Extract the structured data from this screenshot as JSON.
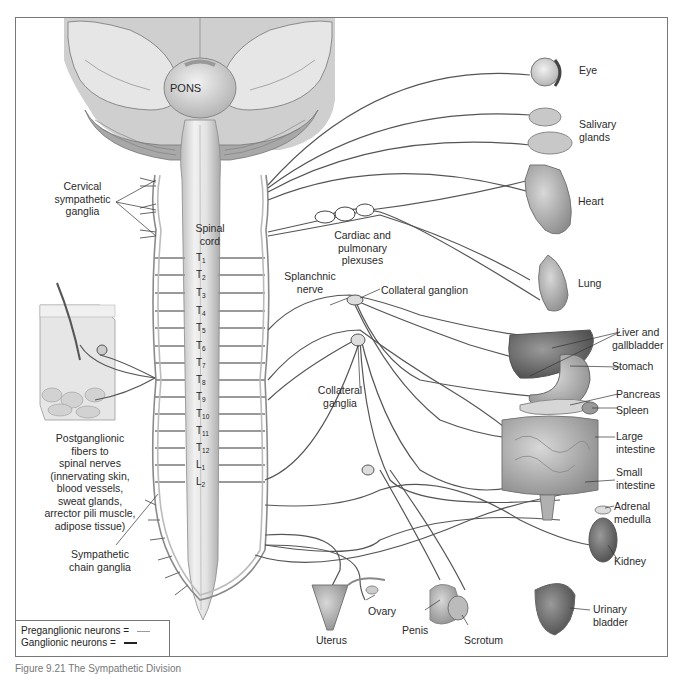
{
  "diagram": {
    "title_caption": "Figure 9.21 The Sympathetic Division",
    "brain_label": "PONS",
    "spinal_cord_label": "Spinal cord",
    "segments": [
      {
        "letter": "T",
        "sub": "1"
      },
      {
        "letter": "T",
        "sub": "2"
      },
      {
        "letter": "T",
        "sub": "3"
      },
      {
        "letter": "T",
        "sub": "4"
      },
      {
        "letter": "T",
        "sub": "5"
      },
      {
        "letter": "T",
        "sub": "6"
      },
      {
        "letter": "T",
        "sub": "7"
      },
      {
        "letter": "T",
        "sub": "8"
      },
      {
        "letter": "T",
        "sub": "9"
      },
      {
        "letter": "T",
        "sub": "10"
      },
      {
        "letter": "T",
        "sub": "11"
      },
      {
        "letter": "T",
        "sub": "12"
      },
      {
        "letter": "L",
        "sub": "1"
      },
      {
        "letter": "L",
        "sub": "2"
      }
    ],
    "left_labels": {
      "cervical": [
        "Cervical",
        "sympathetic",
        "ganglia"
      ],
      "postganglionic": [
        "Postganglionic",
        "fibers to",
        "spinal nerves",
        "(innervating skin,",
        "blood vessels,",
        "sweat glands,",
        "arrector pili muscle,",
        "adipose tissue)"
      ],
      "chain": [
        "Sympathetic",
        "chain ganglia"
      ]
    },
    "center_labels": {
      "cardiac": [
        "Cardiac and",
        "pulmonary",
        "plexuses"
      ],
      "splanchnic": [
        "Splanchnic",
        "nerve"
      ],
      "collateral_ganglion": "Collateral ganglion",
      "collateral_ganglia": [
        "Collateral",
        "ganglia"
      ]
    },
    "organs": {
      "eye": "Eye",
      "salivary": [
        "Salivary",
        "glands"
      ],
      "heart": "Heart",
      "lung": "Lung",
      "liver": [
        "Liver and",
        "gallbladder"
      ],
      "stomach": "Stomach",
      "pancreas": "Pancreas",
      "spleen": "Spleen",
      "large_intestine": [
        "Large",
        "intestine"
      ],
      "small_intestine": [
        "Small",
        "intestine"
      ],
      "adrenal": [
        "Adrenal",
        "medulla"
      ],
      "kidney": "Kidney",
      "bladder": [
        "Urinary",
        "bladder"
      ],
      "uterus": "Uterus",
      "ovary": "Ovary",
      "penis": "Penis",
      "scrotum": "Scrotum"
    },
    "legend": {
      "preganglionic": "Preganglionic neurons =",
      "ganglionic": "Ganglionic neurons =",
      "preganglionic_color": "#9a9a9a",
      "ganglionic_color": "#222222"
    }
  }
}
